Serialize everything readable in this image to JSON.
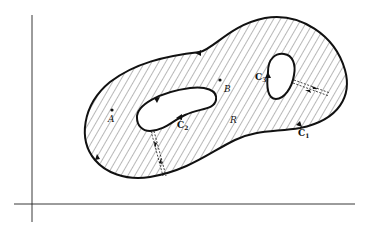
{
  "figure": {
    "region_label": "R",
    "points": [
      {
        "label": "A"
      },
      {
        "label": "B"
      }
    ],
    "curves": [
      {
        "label": "C",
        "subscript": "1"
      },
      {
        "label": "C",
        "subscript": "2"
      },
      {
        "label": "C",
        "subscript": "3"
      }
    ],
    "colors": {
      "stroke": "#111111",
      "hatch": "#333333",
      "background": "#ffffff"
    }
  }
}
